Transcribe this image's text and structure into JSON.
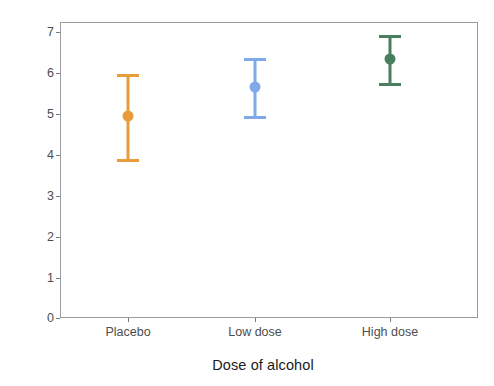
{
  "chart_data": {
    "type": "scatter",
    "title": "",
    "xlabel": "Dose of alcohol",
    "ylabel": "Mean attractiveness rating",
    "categories": [
      "Placebo",
      "Low dose",
      "High dose"
    ],
    "values": [
      4.95,
      5.65,
      6.35
    ],
    "error_low": [
      3.9,
      4.95,
      5.75
    ],
    "error_high": [
      5.97,
      6.37,
      6.92
    ],
    "yticks": [
      0,
      1,
      2,
      3,
      4,
      5,
      6,
      7
    ],
    "ylim": [
      -0.08,
      7.2
    ],
    "grid": false,
    "legend": "none",
    "series": [
      {
        "name": "Placebo",
        "value": 4.95,
        "lower": 3.9,
        "upper": 5.97,
        "color": "#E89C3A"
      },
      {
        "name": "Low dose",
        "value": 5.65,
        "lower": 4.95,
        "upper": 6.37,
        "color": "#7FA9E8"
      },
      {
        "name": "High dose",
        "value": 6.35,
        "lower": 5.75,
        "upper": 6.92,
        "color": "#4A7F5E"
      }
    ]
  },
  "axes": {
    "y_title": "Mean attractiveness rating",
    "x_title": "Dose of alcohol",
    "y_tick_labels": [
      "7",
      "6",
      "5",
      "4",
      "3",
      "2",
      "1",
      "0"
    ],
    "x_tick_labels": [
      "Placebo",
      "Low dose",
      "High dose"
    ]
  },
  "colors": {
    "placebo": "#E89C3A",
    "low_dose": "#7FA9E8",
    "high_dose": "#4A7F5E",
    "panel_border": "#9b9ba3",
    "tick_text": "#4d4d4d",
    "title_text": "#1a1a1a",
    "background": "#ffffff"
  }
}
